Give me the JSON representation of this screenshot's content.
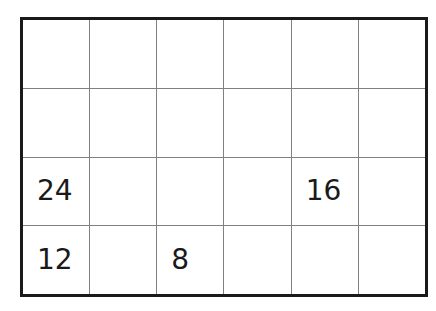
{
  "figure": {
    "type": "grid-table",
    "rows": 4,
    "columns": 6,
    "border_color": "#1a1a1a",
    "gridline_color": "#808080",
    "background_color": "#ffffff",
    "text_color": "#1a1a1a"
  },
  "chart_data": {
    "type": "table",
    "title": "",
    "xlabel": "",
    "ylabel": "",
    "rows": 4,
    "columns": 6,
    "cells": [
      [
        "",
        "",
        "",
        "",
        "",
        ""
      ],
      [
        "",
        "",
        "",
        "",
        "",
        ""
      ],
      [
        "24",
        "",
        "",
        "",
        "16",
        ""
      ],
      [
        "12",
        "",
        "8",
        "",
        "",
        ""
      ]
    ],
    "filled_values": [
      {
        "row": 3,
        "column": 1,
        "value": "24"
      },
      {
        "row": 3,
        "column": 5,
        "value": "16"
      },
      {
        "row": 4,
        "column": 1,
        "value": "12"
      },
      {
        "row": 4,
        "column": 3,
        "value": "8"
      }
    ],
    "grid": true,
    "legend": "none"
  }
}
